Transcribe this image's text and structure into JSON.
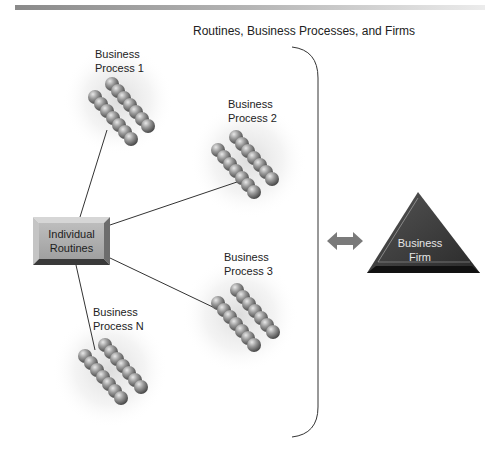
{
  "figure": {
    "title": "Routines, Business Processes, and Firms"
  },
  "nodes": {
    "individual_routines": {
      "line1": "Individual",
      "line2": "Routines"
    },
    "process_1": {
      "line1": "Business",
      "line2": "Process 1"
    },
    "process_2": {
      "line1": "Business",
      "line2": "Process 2"
    },
    "process_3": {
      "line1": "Business",
      "line2": "Process 3"
    },
    "process_n": {
      "line1": "Business",
      "line2": "Process N"
    },
    "business_firm": {
      "line1": "Business",
      "line2": "Firm"
    }
  },
  "colors": {
    "box_fill": "#a8a8a8",
    "triangle_fill": "#3a3a3a",
    "arrow_fill": "#7a7a7a",
    "bead_fill": "#8c8c8c",
    "connector": "#333333"
  }
}
